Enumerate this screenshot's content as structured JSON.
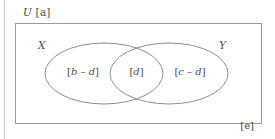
{
  "figure": {
    "type": "venn-diagram",
    "universe": {
      "symbol": "U",
      "cardinality_label": "[a]",
      "title": "U [a]",
      "outside_label": "[e]"
    },
    "sets": [
      {
        "id": "X",
        "name": "X",
        "position": "left"
      },
      {
        "id": "Y",
        "name": "Y",
        "position": "right"
      }
    ],
    "regions": [
      {
        "id": "left-only",
        "label": "[b – d]",
        "meaning": "X only"
      },
      {
        "id": "intersection",
        "label": "[d]",
        "meaning": "X and Y"
      },
      {
        "id": "right-only",
        "label": "[c – d]",
        "meaning": "Y only"
      },
      {
        "id": "outside",
        "label": "[e]",
        "meaning": "outside X and Y"
      }
    ],
    "colors": {
      "stroke": "#8d8d8d",
      "box_stroke": "#9a9a9a",
      "text": "#4a4a4a",
      "background": "#ffffff"
    }
  }
}
